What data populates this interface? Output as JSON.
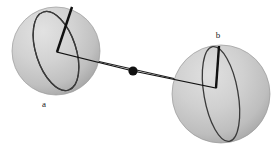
{
  "figure": {
    "background_color": "#ffffff",
    "width": 277,
    "height": 151
  },
  "colors": {
    "sphere_fill_light": "#d8d8d8",
    "sphere_fill_mid": "#c2c2c2",
    "sphere_fill_dark": "#a8a8a8",
    "sphere_edge": "#8f8f8f",
    "ring_stroke": "#3a3a3a",
    "line_stroke": "#1e1e1e",
    "vector_stroke": "#111111",
    "dot_fill": "#111111",
    "label_color": "#1a1a1a"
  },
  "spheres": [
    {
      "id": "sphere-a",
      "label": "a",
      "label_x": 44,
      "label_y": 107,
      "center_x": 56,
      "center_y": 51,
      "radius": 44,
      "ring": {
        "rx": 41,
        "ry": 20,
        "rotation_deg": 72
      },
      "vector": {
        "vertex_x": 57,
        "vertex_y": 52,
        "tip_x": 72,
        "tip_y": 7
      }
    },
    {
      "id": "sphere-b",
      "label": "b",
      "label_x": 218,
      "label_y": 38,
      "center_x": 221,
      "center_y": 94,
      "radius": 49,
      "ring": {
        "rx": 48,
        "ry": 17,
        "rotation_deg": 80
      },
      "vector": {
        "vertex_x": 216,
        "vertex_y": 88,
        "tip_x": 219,
        "tip_y": 46
      }
    }
  ],
  "connector": {
    "start_x": 57,
    "start_y": 52,
    "end_x": 216,
    "end_y": 88,
    "stroke_width": 1
  },
  "source_dot": {
    "center_x": 133,
    "center_y": 71,
    "radius": 4.6
  }
}
